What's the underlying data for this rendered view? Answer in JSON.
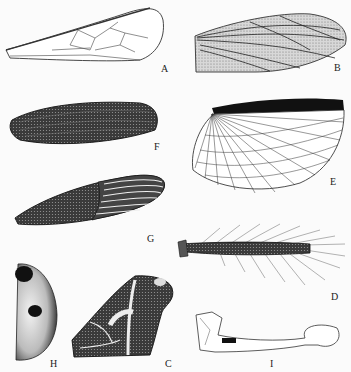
{
  "figure": {
    "type": "plate of insect wing types",
    "panels": [
      {
        "id": "A",
        "label": "A",
        "description": "membranous wing with sparse veins"
      },
      {
        "id": "B",
        "label": "B",
        "description": "parchment-like wing with longitudinal veins"
      },
      {
        "id": "C",
        "label": "C",
        "description": "patterned wing with pale bands"
      },
      {
        "id": "D",
        "label": "D",
        "description": "narrow fringed wing"
      },
      {
        "id": "E",
        "label": "E",
        "description": "fan-shaped hind wing with dark costal margin"
      },
      {
        "id": "F",
        "label": "F",
        "description": "dark leathery wing"
      },
      {
        "id": "G",
        "label": "G",
        "description": "hemelytron with membranous striated apex"
      },
      {
        "id": "H",
        "label": "H",
        "description": "hardened elytron with dark spots"
      },
      {
        "id": "I",
        "label": "I",
        "description": "haltere (club-shaped)"
      }
    ]
  }
}
